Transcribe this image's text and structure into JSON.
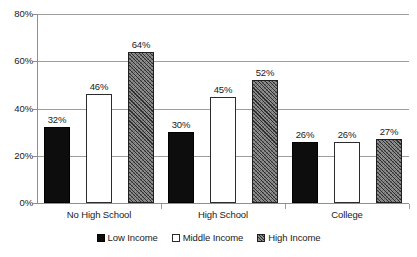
{
  "chart_data": {
    "type": "bar",
    "title": "",
    "subtitle": "",
    "xlabel": "",
    "ylabel": "",
    "categories": [
      "No High School",
      "High School",
      "College"
    ],
    "series": [
      {
        "name": "Low Income",
        "values": [
          32,
          30,
          26
        ],
        "swatch": "solid-black",
        "color": "#0d0d0d"
      },
      {
        "name": "Middle Income",
        "values": [
          46,
          45,
          26
        ],
        "swatch": "open-white",
        "color": "#ffffff"
      },
      {
        "name": "High Income",
        "values": [
          64,
          52,
          27
        ],
        "swatch": "hatched-gray",
        "color": "#8d8d8d"
      }
    ],
    "data_labels": [
      [
        "32%",
        "46%",
        "64%"
      ],
      [
        "30%",
        "45%",
        "52%"
      ],
      [
        "26%",
        "26%",
        "27%"
      ]
    ],
    "ylim": [
      0,
      80
    ],
    "y_ticks": [
      0,
      20,
      40,
      60,
      80
    ],
    "y_tick_labels": [
      "0%",
      "20%",
      "40%",
      "60%",
      "80%"
    ],
    "grid": true,
    "grid_axis": "y",
    "legend_position": "bottom-center",
    "value_unit": "%"
  },
  "legend": {
    "items": [
      {
        "label": "Low Income"
      },
      {
        "label": "Middle Income"
      },
      {
        "label": "High Income"
      }
    ]
  }
}
